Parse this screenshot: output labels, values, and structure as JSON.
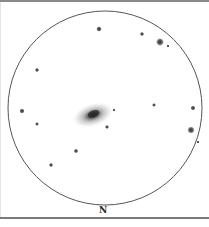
{
  "sketch": {
    "orientation_label": "N",
    "field_circle": {
      "cx": 105,
      "cy": 108,
      "r": 97,
      "stroke": "#555555"
    },
    "galaxy": {
      "cx": 93,
      "cy": 115,
      "rx": 22,
      "ry": 12,
      "rotation": -18,
      "core_color": "#2a2a2a",
      "halo_color": "#9a9a9a"
    },
    "stars": [
      {
        "x": 99,
        "y": 29,
        "r": 2.2
      },
      {
        "x": 142,
        "y": 34,
        "r": 1.6
      },
      {
        "x": 160,
        "y": 42,
        "r": 3.4
      },
      {
        "x": 168,
        "y": 46,
        "r": 1.0
      },
      {
        "x": 37,
        "y": 70,
        "r": 1.6
      },
      {
        "x": 22,
        "y": 111,
        "r": 2.0
      },
      {
        "x": 37,
        "y": 124,
        "r": 1.4
      },
      {
        "x": 154,
        "y": 105,
        "r": 1.4
      },
      {
        "x": 193,
        "y": 108,
        "r": 1.9
      },
      {
        "x": 191,
        "y": 130,
        "r": 3.1
      },
      {
        "x": 198,
        "y": 142,
        "r": 1.0
      },
      {
        "x": 107,
        "y": 127,
        "r": 1.5
      },
      {
        "x": 114,
        "y": 110,
        "r": 1.0
      },
      {
        "x": 76,
        "y": 151,
        "r": 1.7
      },
      {
        "x": 51,
        "y": 165,
        "r": 1.6
      }
    ]
  }
}
